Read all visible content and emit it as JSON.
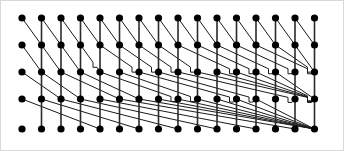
{
  "figure": {
    "name": "sorting-network-diagram",
    "title": "Sorting network node lattice",
    "width": 344,
    "height": 151,
    "background_color": "#ffffff",
    "border_color": "#d8d8d8"
  },
  "chart_data": {
    "type": "scatter",
    "title": "Sorting network node lattice",
    "xlabel": "",
    "ylabel": "",
    "grid": false,
    "legend": null,
    "rows": 5,
    "columns": 16,
    "row_count_label": "5",
    "column_count_label": "16",
    "node_total": 80,
    "node_color": "#000000",
    "node_radius": 3.6,
    "wire_color": "#1a1a1a",
    "rail_color": "#2b2b2b",
    "x": [
      21,
      40.5,
      60,
      79.5,
      99,
      118.5,
      138,
      157.5,
      177,
      196.5,
      216,
      235.5,
      255,
      274.5,
      294,
      313.5
    ],
    "y": [
      17,
      44,
      71,
      98,
      128
    ],
    "xlim": [
      0,
      344
    ],
    "ylim": [
      0,
      151
    ],
    "row_labels": [
      "r1",
      "r2",
      "r3",
      "r4",
      "r5"
    ],
    "column_labels": [
      "c1",
      "c2",
      "c3",
      "c4",
      "c5",
      "c6",
      "c7",
      "c8",
      "c9",
      "c10",
      "c11",
      "c12",
      "c13",
      "c14",
      "c15",
      "c16"
    ],
    "series": [
      {
        "name": "row-1-nodes",
        "y_value": 17,
        "values": [
          21,
          40.5,
          60,
          79.5,
          99,
          118.5,
          138,
          157.5,
          177,
          196.5,
          216,
          235.5,
          255,
          274.5,
          294,
          313.5
        ]
      },
      {
        "name": "row-2-nodes",
        "y_value": 44,
        "values": [
          21,
          40.5,
          60,
          79.5,
          99,
          118.5,
          138,
          157.5,
          177,
          196.5,
          216,
          235.5,
          255,
          274.5,
          294,
          313.5
        ]
      },
      {
        "name": "row-3-nodes",
        "y_value": 71,
        "values": [
          21,
          40.5,
          60,
          79.5,
          99,
          118.5,
          138,
          157.5,
          177,
          196.5,
          216,
          235.5,
          255,
          274.5,
          294,
          313.5
        ]
      },
      {
        "name": "row-4-nodes",
        "y_value": 98,
        "values": [
          21,
          40.5,
          60,
          79.5,
          99,
          118.5,
          138,
          157.5,
          177,
          196.5,
          216,
          235.5,
          255,
          274.5,
          294,
          313.5
        ]
      },
      {
        "name": "row-5-nodes",
        "y_value": 128,
        "values": [
          21,
          40.5,
          60,
          79.5,
          99,
          118.5,
          138,
          157.5,
          177,
          196.5,
          216,
          235.5,
          255,
          274.5,
          294,
          313.5
        ]
      }
    ],
    "edges": {
      "vertical_rails": {
        "description": "vertical segments joining a node to the node directly above it, present from column 2 rightwards",
        "first_column_index": 1,
        "row_pairs": [
          [
            0,
            1
          ],
          [
            1,
            2
          ],
          [
            2,
            3
          ],
          [
            3,
            4
          ]
        ]
      },
      "diagonals_row1_row2": {
        "description": "single-column diagonal from each row-1 node down-right to the row-2 node",
        "span_columns": 1
      },
      "diagonals_row2_row3": {
        "description": "diagonals from row-2 nodes fanning down-right toward row 3, spanning increasing column counts",
        "span_columns_min": 1,
        "span_columns_max": 4
      },
      "diagonals_row3_row4": {
        "description": "shallow diagonals from row-3 nodes down-right to row-4 nodes, spanning several columns",
        "span_columns_min": 2,
        "span_columns_max": 7
      },
      "diagonals_row4_row5": {
        "description": "very shallow long diagonals bundled from row-4 nodes down-right to row-5 nodes",
        "span_columns_min": 4,
        "span_columns_max": 12
      },
      "jogs": {
        "description": "small step/jog notches where a wire offsets vertically just left of a rail",
        "width": 4,
        "height": 5
      }
    },
    "annotations": []
  }
}
